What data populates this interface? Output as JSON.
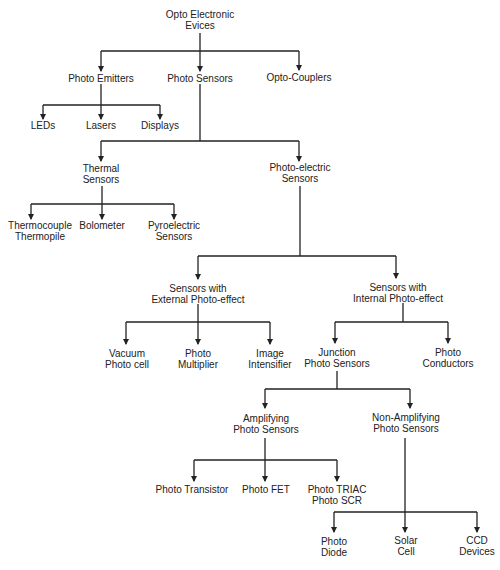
{
  "diagram": {
    "type": "hierarchy-tree",
    "colors": {
      "line": "#222222",
      "text": "#222222",
      "background": "#ffffff"
    },
    "nodes": {
      "root": {
        "line1": "Opto Electronic",
        "line2": "Evices"
      },
      "photo_emitters": {
        "line1": "Photo Emitters"
      },
      "photo_sensors": {
        "line1": "Photo Sensors"
      },
      "opto_couplers": {
        "line1": "Opto-Couplers"
      },
      "leds": {
        "line1": "LEDs"
      },
      "lasers": {
        "line1": "Lasers"
      },
      "displays": {
        "line1": "Displays"
      },
      "thermal_sensors": {
        "line1": "Thermal",
        "line2": "Sensors"
      },
      "photo_electric_sensors": {
        "line1": "Photo-electric",
        "line2": "Sensors"
      },
      "thermocouple": {
        "line1": "Thermocouple",
        "line2": "Thermopile"
      },
      "bolometer": {
        "line1": "Bolometer"
      },
      "pyroelectric": {
        "line1": "Pyroelectric",
        "line2": "Sensors"
      },
      "external": {
        "line1": "Sensors with",
        "line2": "External Photo-effect"
      },
      "internal": {
        "line1": "Sensors with",
        "line2": "Internal Photo-effect"
      },
      "vacuum_photo_cell": {
        "line1": "Vacuum",
        "line2": "Photo cell"
      },
      "photo_multiplier": {
        "line1": "Photo",
        "line2": "Multiplier"
      },
      "image_intensifier": {
        "line1": "Image",
        "line2": "Intensifier"
      },
      "junction": {
        "line1": "Junction",
        "line2": "Photo Sensors"
      },
      "photo_conductors": {
        "line1": "Photo",
        "line2": "Conductors"
      },
      "amplifying": {
        "line1": "Amplifying",
        "line2": "Photo Sensors"
      },
      "non_amplifying": {
        "line1": "Non-Amplifying",
        "line2": "Photo Sensors"
      },
      "photo_transistor": {
        "line1": "Photo Transistor"
      },
      "photo_fet": {
        "line1": "Photo FET"
      },
      "photo_triac": {
        "line1": "Photo TRIAC",
        "line2": "Photo SCR"
      },
      "photo_diode": {
        "line1": "Photo",
        "line2": "Diode"
      },
      "solar_cell": {
        "line1": "Solar",
        "line2": "Cell"
      },
      "ccd_devices": {
        "line1": "CCD",
        "line2": "Devices"
      }
    },
    "edges": [
      [
        "root",
        "photo_emitters"
      ],
      [
        "root",
        "photo_sensors"
      ],
      [
        "root",
        "opto_couplers"
      ],
      [
        "photo_emitters",
        "leds"
      ],
      [
        "photo_emitters",
        "lasers"
      ],
      [
        "photo_emitters",
        "displays"
      ],
      [
        "photo_sensors",
        "thermal_sensors"
      ],
      [
        "photo_sensors",
        "photo_electric_sensors"
      ],
      [
        "thermal_sensors",
        "thermocouple"
      ],
      [
        "thermal_sensors",
        "bolometer"
      ],
      [
        "thermal_sensors",
        "pyroelectric"
      ],
      [
        "photo_electric_sensors",
        "external"
      ],
      [
        "photo_electric_sensors",
        "internal"
      ],
      [
        "external",
        "vacuum_photo_cell"
      ],
      [
        "external",
        "photo_multiplier"
      ],
      [
        "external",
        "image_intensifier"
      ],
      [
        "internal",
        "junction"
      ],
      [
        "internal",
        "photo_conductors"
      ],
      [
        "junction",
        "amplifying"
      ],
      [
        "junction",
        "non_amplifying"
      ],
      [
        "amplifying",
        "photo_transistor"
      ],
      [
        "amplifying",
        "photo_fet"
      ],
      [
        "amplifying",
        "photo_triac"
      ],
      [
        "non_amplifying",
        "photo_diode"
      ],
      [
        "non_amplifying",
        "solar_cell"
      ],
      [
        "non_amplifying",
        "ccd_devices"
      ]
    ]
  }
}
